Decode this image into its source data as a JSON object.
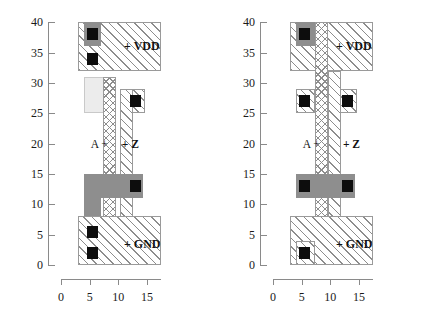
{
  "figure": {
    "type": "vlsi-layout-comparison",
    "panel_count": 2
  },
  "axes": {
    "y_ticks": [
      "0",
      "5",
      "10",
      "15",
      "20",
      "25",
      "30",
      "35",
      "40"
    ],
    "y_values": [
      0,
      5,
      10,
      15,
      20,
      25,
      30,
      35,
      40
    ],
    "y_min": 0,
    "y_max": 40,
    "x_ticks": [
      "0",
      "5",
      "10",
      "15"
    ],
    "x_values": [
      0,
      5,
      10,
      15
    ],
    "x_min": 0,
    "x_max": 17.5
  },
  "colors": {
    "diffusion": "#8e8e8e",
    "contact": "#0d0d0d",
    "light_region": "#ececec",
    "hatch_line": "#8d8d8d",
    "axis": "#8a8a8a",
    "text": "#111111"
  },
  "panels": [
    {
      "id": "left",
      "name": "layout-left",
      "labels": {
        "vdd": "+ VDD",
        "gnd": "+ GND",
        "input": "A +",
        "output": "+ Z"
      },
      "regions": [
        {
          "name": "vdd-metal-rail",
          "layer": "metal",
          "x": 3.0,
          "y": 32.0,
          "w": 14.5,
          "h": 8.0
        },
        {
          "name": "pmos-diffusion",
          "layer": "diff",
          "x": 4.0,
          "y": 36.0,
          "w": 3.0,
          "h": 4.0
        },
        {
          "name": "well-contact-box",
          "layer": "lightbox",
          "x": 4.0,
          "y": 25.0,
          "w": 4.7,
          "h": 6.0
        },
        {
          "name": "output-metal-tab",
          "layer": "metal",
          "x": 10.3,
          "y": 25.0,
          "w": 4.3,
          "h": 4.0
        },
        {
          "name": "poly-gate-strip",
          "layer": "poly",
          "x": 7.3,
          "y": 0.0,
          "w": 2.3,
          "h": 31.0
        },
        {
          "name": "output-metal-strip",
          "layer": "metal",
          "x": 10.3,
          "y": 0.0,
          "w": 2.3,
          "h": 29.0
        },
        {
          "name": "nmos-diffusion-l",
          "layer": "diff",
          "x": 4.0,
          "y": 4.0,
          "w": 3.0,
          "h": 11.0
        },
        {
          "name": "nmos-diffusion-r",
          "layer": "diff",
          "x": 7.0,
          "y": 11.0,
          "w": 7.3,
          "h": 4.0
        },
        {
          "name": "gnd-metal-rail",
          "layer": "metal",
          "x": 3.0,
          "y": 0.0,
          "w": 14.5,
          "h": 8.0
        }
      ],
      "contacts": [
        {
          "name": "contact-vdd-pmos",
          "x": 5.5,
          "y": 38.0
        },
        {
          "name": "contact-vdd-lower",
          "x": 5.5,
          "y": 34.0
        },
        {
          "name": "contact-output",
          "x": 13.0,
          "y": 27.0
        },
        {
          "name": "contact-drain",
          "x": 13.0,
          "y": 13.0
        },
        {
          "name": "contact-gnd-upper",
          "x": 5.5,
          "y": 5.5
        },
        {
          "name": "contact-gnd-lower",
          "x": 5.5,
          "y": 2.0
        }
      ]
    },
    {
      "id": "right",
      "name": "layout-right",
      "labels": {
        "vdd": "+ VDD",
        "gnd": "+ GND",
        "input": "A +",
        "output": "+ Z"
      },
      "regions": [
        {
          "name": "vdd-metal-rail",
          "layer": "metal",
          "x": 3.0,
          "y": 32.0,
          "w": 14.5,
          "h": 8.0
        },
        {
          "name": "pmos-diffusion",
          "layer": "diff",
          "x": 4.0,
          "y": 36.0,
          "w": 3.3,
          "h": 4.0
        },
        {
          "name": "mid-metal-left",
          "layer": "metal",
          "x": 4.0,
          "y": 25.0,
          "w": 3.3,
          "h": 4.0
        },
        {
          "name": "mid-metal-right",
          "layer": "metal",
          "x": 11.3,
          "y": 25.0,
          "w": 3.3,
          "h": 4.0
        },
        {
          "name": "poly-gate-strip",
          "layer": "poly",
          "x": 7.3,
          "y": 0.0,
          "w": 2.3,
          "h": 40.0
        },
        {
          "name": "output-metal-strip",
          "layer": "metal",
          "x": 9.6,
          "y": 0.0,
          "w": 2.3,
          "h": 32.0
        },
        {
          "name": "nmos-diffusion",
          "layer": "diff",
          "x": 4.0,
          "y": 11.0,
          "w": 10.3,
          "h": 4.0
        },
        {
          "name": "gnd-metal-rail",
          "layer": "metal",
          "x": 3.0,
          "y": 0.0,
          "w": 14.5,
          "h": 8.0
        },
        {
          "name": "gnd-contact-box",
          "layer": "metal",
          "x": 4.0,
          "y": 0.0,
          "w": 3.3,
          "h": 4.0
        }
      ],
      "contacts": [
        {
          "name": "contact-vdd-pmos",
          "x": 5.5,
          "y": 38.0
        },
        {
          "name": "contact-mid-left",
          "x": 5.5,
          "y": 27.0
        },
        {
          "name": "contact-mid-right",
          "x": 13.0,
          "y": 27.0
        },
        {
          "name": "contact-source",
          "x": 5.5,
          "y": 13.0
        },
        {
          "name": "contact-drain",
          "x": 13.0,
          "y": 13.0
        },
        {
          "name": "contact-gnd",
          "x": 5.5,
          "y": 2.0
        }
      ]
    }
  ]
}
